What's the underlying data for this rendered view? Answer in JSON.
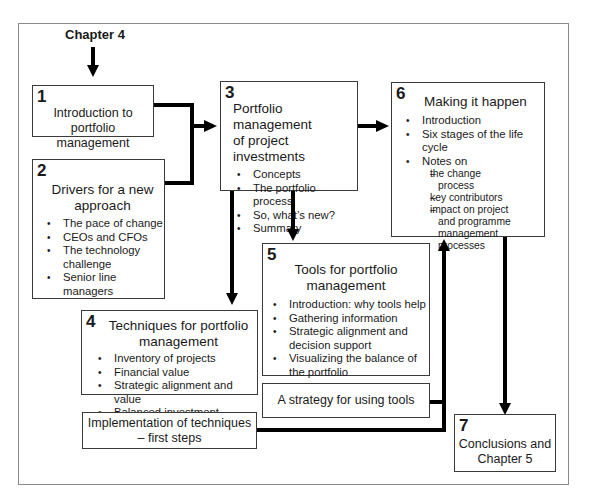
{
  "diagram": {
    "start_label": "Chapter 4",
    "boxes": {
      "b1": {
        "number": "1",
        "title_lines": [
          "Introduction to portfolio",
          "management"
        ],
        "items": []
      },
      "b2": {
        "number": "2",
        "title_lines": [
          "Drivers for a new",
          "approach"
        ],
        "items": [
          "The pace of change",
          "CEOs and CFOs",
          "The technology",
          "challenge",
          "Senior line",
          "managers"
        ]
      },
      "b3": {
        "number": "3",
        "title_lines": [
          "Portfolio management",
          "of project investments"
        ],
        "items": [
          "Concepts",
          "The portfolio process",
          "So, what’s new?",
          "Summary"
        ]
      },
      "b4": {
        "number": "4",
        "title_lines": [
          "Techniques for portfolio",
          "management"
        ],
        "items": [
          "Inventory of projects",
          "Financial value",
          "Strategic alignment and value",
          "Balanced investment",
          "Other techniques"
        ]
      },
      "b5": {
        "number": "5",
        "title_lines": [
          "Tools for portfolio",
          "management"
        ],
        "items": [
          "Introduction: why tools help",
          "Gathering information",
          "Strategic alignment and",
          "decision support",
          "Visualizing the balance of",
          "the portfolio"
        ]
      },
      "b6": {
        "number": "6",
        "title_lines": [
          "Making it happen"
        ],
        "items": [
          "Introduction",
          "Six stages of the life",
          "cycle",
          "Notes on"
        ],
        "subitems": [
          "the change",
          "process",
          "key contributors",
          "impact on project",
          "and programme",
          "management processes"
        ]
      },
      "b7": {
        "number": "7",
        "title_lines": [
          "Conclusions and",
          "Chapter 5"
        ]
      },
      "impl": {
        "title_lines": [
          "Implementation of techniques",
          "– first steps"
        ]
      },
      "strategy": {
        "title_lines": [
          "A strategy for using tools"
        ]
      }
    },
    "colors": {
      "stroke": "#000000",
      "box_border": "#3a3a3a",
      "frame_border": "#8a8a8a",
      "background": "#ffffff"
    }
  }
}
